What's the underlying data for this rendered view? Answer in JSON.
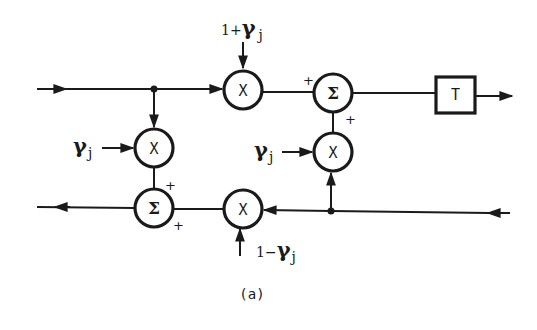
{
  "diagram": {
    "caption": "(a)",
    "colors": {
      "ink": "#1a1a1a",
      "background": "#ffffff"
    },
    "nodes": {
      "mult_top": {
        "symbol": "X",
        "gain": {
          "prefix": "1+",
          "greek": "γ",
          "sub": "j"
        }
      },
      "mult_left": {
        "symbol": "X",
        "gain": {
          "greek": "γ",
          "sub": "j"
        }
      },
      "mult_right": {
        "symbol": "X",
        "gain": {
          "greek": "γ",
          "sub": "j"
        }
      },
      "mult_bottom": {
        "symbol": "X",
        "gain": {
          "prefix": "1−",
          "greek": "γ",
          "sub": "j"
        }
      },
      "sum_top": {
        "symbol": "Σ",
        "signs": [
          "+",
          "+"
        ]
      },
      "sum_bottom": {
        "symbol": "Σ",
        "signs": [
          "+",
          "+"
        ]
      },
      "delay": {
        "symbol": "T"
      }
    },
    "edges": [
      "input (top-left) → junction A",
      "junction A → mult_top",
      "junction A → mult_left",
      "mult_top → sum_top (+)",
      "mult_right → sum_top (+)",
      "sum_top → delay T → output (top-right)",
      "input (bottom-right) → junction B",
      "junction B → mult_right",
      "junction B → mult_bottom",
      "mult_left → sum_bottom (+)",
      "mult_bottom → sum_bottom (+)",
      "sum_bottom → output (bottom-left)"
    ]
  }
}
